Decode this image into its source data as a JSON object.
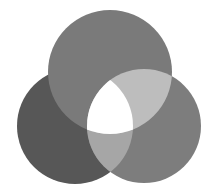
{
  "diagram": {
    "type": "three-circle-overlap",
    "background": "#ffffff",
    "circles": [
      {
        "id": "left",
        "cx": 75,
        "cy": 126,
        "r": 58,
        "fill": "#575757"
      },
      {
        "id": "top",
        "cx": 110,
        "cy": 72,
        "r": 62,
        "fill": "#7a7a7a"
      },
      {
        "id": "right",
        "cx": 144,
        "cy": 126,
        "r": 57,
        "fill": "#7d7d7d"
      }
    ],
    "overlaps": {
      "top_right": "#bdbdbd",
      "left_right": "#a6a6a6",
      "center": "#ffffff"
    }
  }
}
